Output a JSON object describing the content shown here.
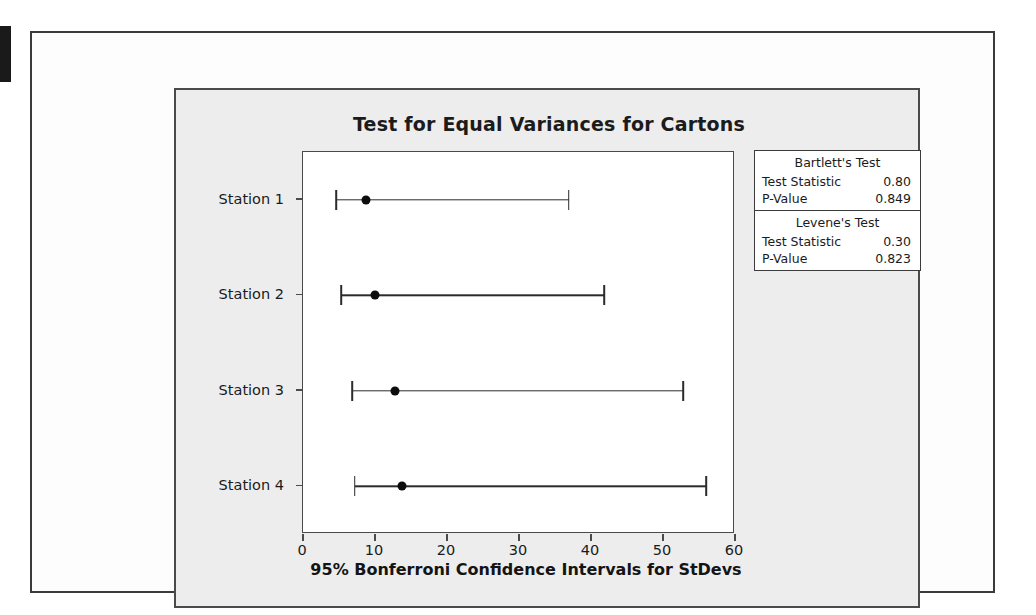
{
  "chart_data": {
    "type": "interval",
    "title": "Test for Equal Variances for Cartons",
    "xlabel": "95% Bonferroni Confidence Intervals for StDevs",
    "ylabel": "",
    "xlim": [
      0,
      60
    ],
    "xticks": [
      0,
      10,
      20,
      30,
      40,
      50,
      60
    ],
    "grid": false,
    "categories": [
      "Station 1",
      "Station 2",
      "Station 3",
      "Station 4"
    ],
    "series": [
      {
        "name": "95% Bonferroni CI for StDev",
        "points": [
          {
            "category": "Station 1",
            "center": 8.7,
            "lower": 4.6,
            "upper": 36.9
          },
          {
            "category": "Station 2",
            "center": 10.0,
            "lower": 5.3,
            "upper": 41.8
          },
          {
            "category": "Station 3",
            "center": 12.8,
            "lower": 6.8,
            "upper": 52.8
          },
          {
            "category": "Station 4",
            "center": 13.7,
            "lower": 7.2,
            "upper": 56.0
          }
        ]
      }
    ],
    "annotations": [
      {
        "label": "Bartlett's Test",
        "rows": [
          [
            "Test Statistic",
            "0.80"
          ],
          [
            "P-Value",
            "0.849"
          ]
        ]
      },
      {
        "label": "Levene's Test",
        "rows": [
          [
            "Test Statistic",
            "0.30"
          ],
          [
            "P-Value",
            "0.823"
          ]
        ]
      }
    ]
  },
  "stats": {
    "bartlett": {
      "heading": "Bartlett's Test",
      "statistic_label": "Test Statistic",
      "statistic_value": "0.80",
      "pvalue_label": "P-Value",
      "pvalue_value": "0.849"
    },
    "levene": {
      "heading": "Levene's Test",
      "statistic_label": "Test Statistic",
      "statistic_value": "0.30",
      "pvalue_label": "P-Value",
      "pvalue_value": "0.823"
    }
  }
}
